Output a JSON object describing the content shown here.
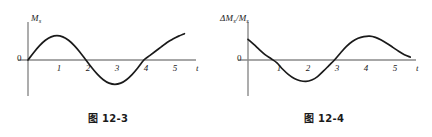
{
  "figures": [
    {
      "id": "12-3",
      "caption": "图 12-3",
      "caption_cjk": "图",
      "caption_num": "12-3",
      "y_axis_label": "Ms",
      "y_axis_label_main": "M",
      "y_axis_label_sub": "s",
      "x_axis_label": "t",
      "origin_label": "0",
      "tick_labels": [
        "1",
        "2",
        "3",
        "4",
        "5"
      ],
      "chart_data": {
        "type": "line",
        "title": "图 12-3",
        "xlabel": "t",
        "ylabel": "Ms",
        "xlim": [
          0,
          5.8
        ],
        "ylim": [
          -1.15,
          1.15
        ],
        "grid": false,
        "legend": null,
        "axis_style": "crossed-axes-at-origin",
        "x_ticks": [
          1,
          2,
          3,
          4,
          5
        ],
        "y_ticks": [
          0
        ],
        "series": [
          {
            "name": "Ms(t)",
            "description": "sine-like wave, zero at t=0, peak near t=1, zero at t=2, trough near t=3, zero at t=4, rising to t=5.4",
            "x": [
              0.0,
              0.2,
              0.4,
              0.6,
              0.8,
              1.0,
              1.2,
              1.4,
              1.6,
              1.8,
              2.0,
              2.2,
              2.4,
              2.6,
              2.8,
              3.0,
              3.2,
              3.4,
              3.6,
              3.8,
              4.0,
              4.2,
              4.4,
              4.6,
              4.8,
              5.0,
              5.2,
              5.4
            ],
            "y": [
              0.0,
              0.31,
              0.59,
              0.81,
              0.95,
              1.0,
              0.95,
              0.81,
              0.59,
              0.31,
              0.0,
              -0.31,
              -0.59,
              -0.81,
              -0.95,
              -1.0,
              -0.95,
              -0.81,
              -0.59,
              -0.31,
              0.0,
              0.18,
              0.36,
              0.54,
              0.72,
              0.86,
              0.98,
              1.08
            ]
          }
        ]
      }
    },
    {
      "id": "12-4",
      "caption": "图 12-4",
      "caption_cjk": "图",
      "caption_num": "12-4",
      "y_axis_label": "ΔMs/Ms",
      "y_axis_delta": "Δ",
      "y_axis_label_main": "M",
      "y_axis_label_sub": "s",
      "y_axis_slash": "/",
      "x_axis_label": "t",
      "origin_label": "0",
      "tick_labels": [
        "1",
        "2",
        "3",
        "4",
        "5"
      ],
      "chart_data": {
        "type": "line",
        "title": "图 12-4",
        "xlabel": "t",
        "ylabel": "ΔMs/Ms",
        "xlim": [
          0,
          5.8
        ],
        "ylim": [
          -1.15,
          1.15
        ],
        "grid": false,
        "legend": null,
        "axis_style": "crossed-axes-at-origin",
        "x_ticks": [
          1,
          2,
          3,
          4,
          5
        ],
        "y_ticks": [
          0
        ],
        "series": [
          {
            "name": "ΔMs/Ms(t)",
            "description": "cosine-like wave, positive at t=0, zero near t=1, trough near t=2, zero near t=3, peak near t=4.2, descending through t=5.5",
            "x": [
              0.0,
              0.2,
              0.4,
              0.6,
              0.8,
              1.0,
              1.2,
              1.4,
              1.6,
              1.8,
              2.0,
              2.2,
              2.4,
              2.6,
              2.8,
              3.0,
              3.2,
              3.4,
              3.6,
              3.8,
              4.0,
              4.2,
              4.4,
              4.6,
              4.8,
              5.0,
              5.2,
              5.4,
              5.6
            ],
            "y": [
              0.85,
              0.64,
              0.42,
              0.21,
              0.05,
              -0.12,
              -0.38,
              -0.6,
              -0.76,
              -0.85,
              -0.88,
              -0.82,
              -0.68,
              -0.46,
              -0.22,
              0.02,
              0.3,
              0.56,
              0.76,
              0.89,
              0.96,
              0.98,
              0.93,
              0.82,
              0.68,
              0.52,
              0.36,
              0.22,
              0.12
            ]
          }
        ]
      }
    }
  ],
  "colors": {
    "curve": "#1a1a1a",
    "axis": "#8a8a8a",
    "text": "#1a1a1a",
    "background": "#ffffff"
  }
}
